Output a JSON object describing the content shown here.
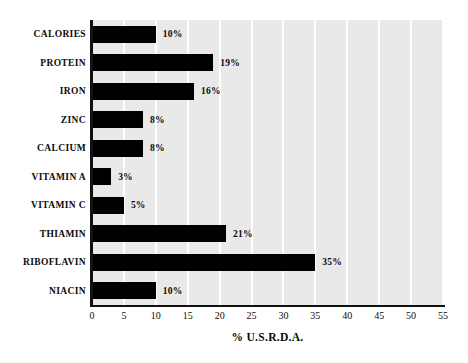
{
  "chart_data": {
    "type": "bar",
    "orientation": "horizontal",
    "title": "",
    "xlabel": "% U.S.R.D.A.",
    "ylabel": "",
    "categories": [
      "CALORIES",
      "PROTEIN",
      "IRON",
      "ZINC",
      "CALCIUM",
      "VITAMIN A",
      "VITAMIN C",
      "THIAMIN",
      "RIBOFLAVIN",
      "NIACIN"
    ],
    "values": [
      10,
      19,
      16,
      8,
      8,
      3,
      5,
      21,
      35,
      10
    ],
    "value_labels": [
      "10%",
      "19%",
      "16%",
      "8%",
      "8%",
      "3%",
      "5%",
      "21%",
      "35%",
      "10%"
    ],
    "xlim": [
      0,
      55
    ],
    "xticks": [
      0,
      5,
      10,
      15,
      20,
      25,
      30,
      35,
      40,
      45,
      50,
      55
    ],
    "xtick_labels": [
      "0",
      "5",
      "10",
      "15",
      "20",
      "25",
      "30",
      "35",
      "40",
      "45",
      "50",
      "55"
    ],
    "grid": "vertical",
    "legend": null,
    "colors": {
      "bar": "#000000",
      "plot_background": "#e9e9e9",
      "gridline": "#fdfdfd",
      "axis": "#111111",
      "text": "#0a0a0a",
      "page_background": "#ffffff"
    }
  }
}
